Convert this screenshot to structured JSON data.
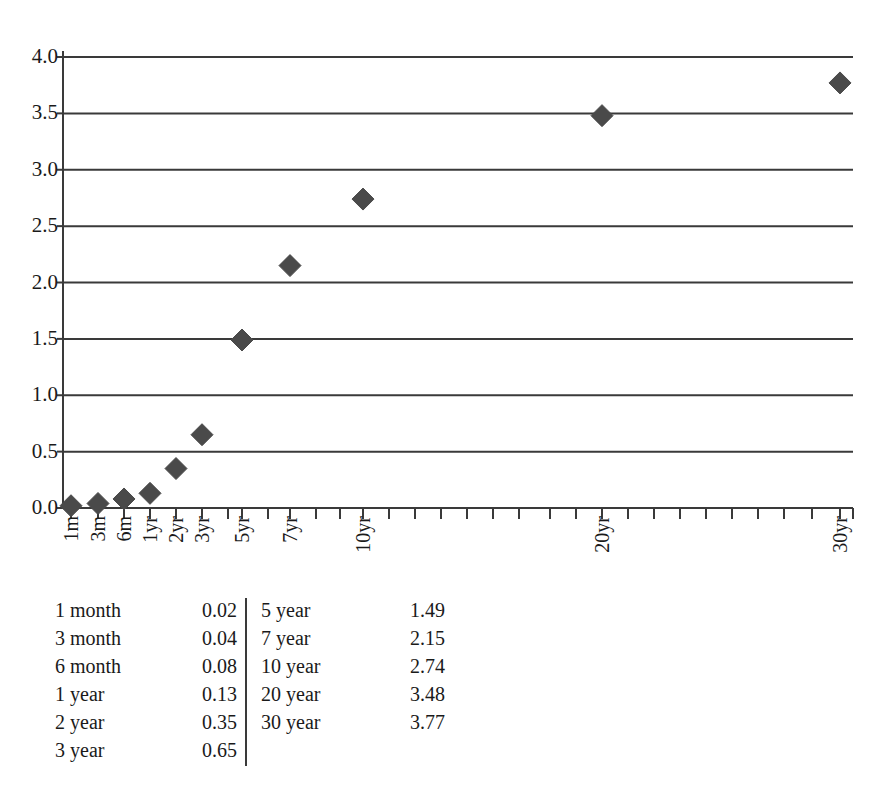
{
  "figure": {
    "title": "",
    "title_note": "cut off at top edge of image"
  },
  "chart_data": {
    "type": "scatter",
    "title": "",
    "xlabel": "",
    "ylabel": "",
    "ylim": [
      0.0,
      4.0
    ],
    "ytick_labels": [
      "4.0",
      "3.5",
      "3.0",
      "2.5",
      "2.0",
      "1.5",
      "1.0",
      "0.5",
      "0.0"
    ],
    "ytick_values": [
      4.0,
      3.5,
      3.0,
      2.5,
      2.0,
      1.5,
      1.0,
      0.5,
      0.0
    ],
    "grid": "horizontal",
    "legend": "none",
    "marker": "diamond",
    "marker_color": "#4a4a4a",
    "axis_color": "#3a3a3a",
    "categories": [
      "1m",
      "3m",
      "6m",
      "1yr",
      "2yr",
      "3yr",
      "5yr",
      "7yr",
      "10yr",
      "20yr",
      "30yr"
    ],
    "values": [
      0.02,
      0.04,
      0.08,
      0.13,
      0.35,
      0.65,
      1.49,
      2.15,
      2.74,
      3.48,
      3.77
    ],
    "points": [
      {
        "label": "1m",
        "x_px": 71,
        "value": 0.02
      },
      {
        "label": "3m",
        "x_px": 98,
        "value": 0.04
      },
      {
        "label": "6m",
        "x_px": 124,
        "value": 0.08
      },
      {
        "label": "1yr",
        "x_px": 150,
        "value": 0.13
      },
      {
        "label": "2yr",
        "x_px": 176,
        "value": 0.35
      },
      {
        "label": "3yr",
        "x_px": 202,
        "value": 0.65
      },
      {
        "label": "5yr",
        "x_px": 242,
        "value": 1.49
      },
      {
        "label": "7yr",
        "x_px": 290,
        "value": 2.15
      },
      {
        "label": "10yr",
        "x_px": 363,
        "value": 2.74
      },
      {
        "label": "20yr",
        "x_px": 602,
        "value": 3.48
      },
      {
        "label": "30yr",
        "x_px": 840,
        "value": 3.77
      }
    ],
    "xtick_positions_px": [
      71,
      98,
      124,
      150,
      176,
      202,
      228,
      242,
      268,
      290,
      316,
      340,
      363,
      389,
      415,
      441,
      467,
      493,
      519,
      550,
      576,
      602,
      628,
      654,
      680,
      706,
      732,
      758,
      784,
      812,
      840
    ],
    "xtick_labeled": [
      "1m",
      "3m",
      "6m",
      "1yr",
      "2yr",
      "3yr",
      "5yr",
      "7yr",
      "10yr",
      "20yr",
      "30yr"
    ]
  },
  "table": {
    "divider": true,
    "left_column": [
      {
        "term": "1 month",
        "value": "0.02"
      },
      {
        "term": "3 month",
        "value": "0.04"
      },
      {
        "term": "6 month",
        "value": "0.08"
      },
      {
        "term": "1 year",
        "value": "0.13"
      },
      {
        "term": "2 year",
        "value": "0.35"
      },
      {
        "term": "3 year",
        "value": "0.65"
      }
    ],
    "right_column": [
      {
        "term": "5 year",
        "value": "1.49"
      },
      {
        "term": "7 year",
        "value": "2.15"
      },
      {
        "term": "10 year",
        "value": "2.74"
      },
      {
        "term": "20 year",
        "value": "3.48"
      },
      {
        "term": "30 year",
        "value": "3.77"
      }
    ]
  }
}
